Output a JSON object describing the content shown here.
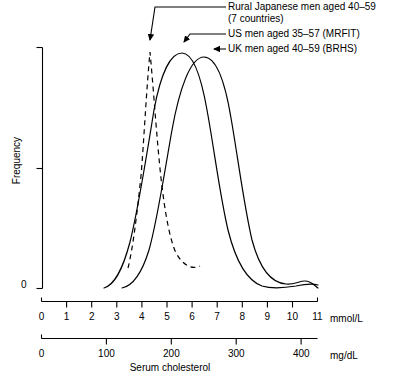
{
  "chart_data": {
    "type": "line",
    "title": "",
    "subtitle": "",
    "xlabel": "Serum cholesterol",
    "ylabel": "Frequency",
    "grid": false,
    "legend_position": "inside-top-right-with-leader-lines",
    "axes": {
      "x_primary": {
        "unit": "mmol/L",
        "ticks": [
          0,
          1,
          2,
          3,
          4,
          5,
          6,
          7,
          8,
          9,
          10,
          11
        ],
        "tick_labels": [
          "0",
          "1",
          "2",
          "3",
          "4",
          "5",
          "6",
          "7",
          "8",
          "9",
          "10",
          "11"
        ],
        "range": [
          0,
          11
        ]
      },
      "x_secondary": {
        "unit": "mg/dL",
        "ticks": [
          0,
          100,
          200,
          300,
          400
        ],
        "tick_labels": [
          "0",
          "100",
          "200",
          "300",
          "400"
        ],
        "range": [
          0,
          425
        ]
      },
      "y": {
        "label": "Frequency",
        "tick_labels": [
          "0"
        ],
        "ticks_shown": [
          "top-bracket",
          "mid-tick",
          "zero"
        ],
        "range": [
          0,
          1
        ]
      }
    },
    "series": [
      {
        "name": "Rural Japanese men aged 40–59 (7 countries)",
        "short_name": "Rural Japanese",
        "style": "dashed",
        "color": "#000000",
        "peak_mmol": 4.0,
        "peak_mgdl": 155,
        "spread_mmol": 0.72,
        "relative_height": 1.0,
        "truncated": true
      },
      {
        "name": "US men aged 35–57 (MRFIT)",
        "short_name": "US men",
        "style": "solid",
        "color": "#000000",
        "peak_mmol": 5.35,
        "peak_mgdl": 207,
        "spread_mmol": 0.95,
        "relative_height": 0.97,
        "truncated": false
      },
      {
        "name": "UK men aged 40–59 (BRHS)",
        "short_name": "UK men",
        "style": "solid",
        "color": "#000000",
        "peak_mmol": 6.1,
        "peak_mgdl": 236,
        "spread_mmol": 1.05,
        "relative_height": 0.94,
        "truncated": false
      }
    ],
    "annotations": [
      {
        "id": "ann-japan",
        "text": "Rural Japanese men aged 40–59",
        "text_line2": "(7 countries)",
        "points_to": "Rural Japanese peak"
      },
      {
        "id": "ann-us",
        "text": "US men aged 35–57 (MRFIT)",
        "points_to": "US men peak"
      },
      {
        "id": "ann-uk",
        "text": "UK men aged 40–59 (BRHS)",
        "points_to": "UK men peak"
      }
    ]
  },
  "legend": {
    "japan_line1": "Rural Japanese men aged 40–59",
    "japan_line2": "(7 countries)",
    "us": "US men aged 35–57 (MRFIT)",
    "uk": "UK men aged 40–59 (BRHS)"
  },
  "axis": {
    "y_label": "Frequency",
    "y_zero": "0",
    "x_title": "Serum cholesterol",
    "unit_mmol": "mmol/L",
    "unit_mgdl": "mg/dL",
    "mmol_ticks": [
      "0",
      "1",
      "2",
      "3",
      "4",
      "5",
      "6",
      "7",
      "8",
      "9",
      "10",
      "11"
    ],
    "mgdl_ticks": [
      "0",
      "100",
      "200",
      "300",
      "400"
    ]
  },
  "colors": {
    "ink": "#000000",
    "background": "#ffffff",
    "leader": "#555555"
  }
}
